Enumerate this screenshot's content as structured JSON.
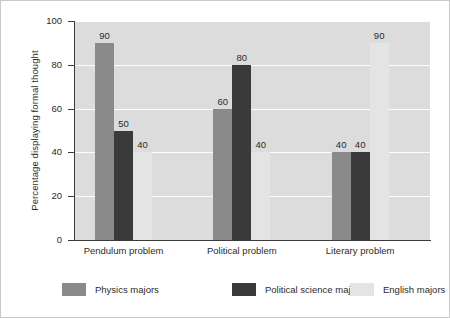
{
  "chart_data": {
    "type": "bar",
    "title": "",
    "subtitle": "",
    "xlabel": "",
    "ylabel": "Percentage displaying formal thought",
    "ylim": [
      0,
      100
    ],
    "yticks": [
      0,
      20,
      40,
      60,
      80,
      100
    ],
    "grid": true,
    "legend_position": "bottom",
    "categories": [
      "Pendulum problem",
      "Political problem",
      "Literary problem"
    ],
    "series": [
      {
        "name": "Physics majors",
        "color": "#8a8a8a",
        "values": [
          90,
          60,
          40
        ]
      },
      {
        "name": "Political science majors",
        "color": "#3a3a3a",
        "values": [
          50,
          80,
          40
        ]
      },
      {
        "name": "English majors",
        "color": "#e4e4e4",
        "values": [
          40,
          40,
          90
        ]
      }
    ],
    "data_labels": [
      [
        "90",
        "50",
        "40"
      ],
      [
        "60",
        "80",
        "40"
      ],
      [
        "40",
        "40",
        "90"
      ]
    ]
  },
  "axis": {
    "y_tick_labels": [
      "0",
      "20",
      "40",
      "60",
      "80",
      "100"
    ]
  },
  "colors": {
    "plot_background": "#dcdcdc",
    "gridline": "#fdfdfd",
    "axis": "#3a3a3a",
    "text": "#2b2b2b",
    "page_background": "#ffffff"
  }
}
